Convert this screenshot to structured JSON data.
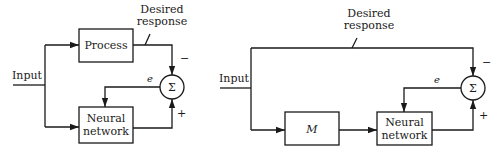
{
  "left_diagram": {
    "input_label": "Input",
    "process_label": "Process",
    "desired_line1": "Desired",
    "desired_line2": "response",
    "nn_line1": "Neural",
    "nn_line2": "network",
    "error_label": "e",
    "sum_symbol": "Σ",
    "minus_sign": "−",
    "plus_sign": "+"
  },
  "right_diagram": {
    "input_label": "Input",
    "model_label": "M",
    "desired_line1": "Desired",
    "desired_line2": "response",
    "nn_line1": "Neural",
    "nn_line2": "network",
    "error_label": "e",
    "sum_symbol": "Σ",
    "minus_sign": "−",
    "plus_sign": "+"
  },
  "colors": {
    "stroke": "#1a1a1a",
    "background": "#ffffff"
  }
}
